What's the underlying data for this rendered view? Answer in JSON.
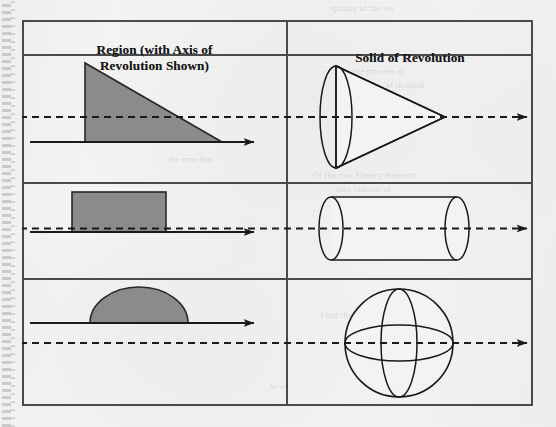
{
  "document": {
    "kind": "textbook-table",
    "page_background": "#f2f2f0",
    "ink_color": "#1a1a1c",
    "region_fill_color": "#8b8b8b",
    "binding": "spiral-perforation-strip"
  },
  "table": {
    "columns": [
      {
        "id": "region",
        "header_line1": "Region (with Axis of",
        "header_line2": "Revolution Shown)"
      },
      {
        "id": "solid",
        "header_line1": "Solid of Revolution",
        "header_line2": ""
      }
    ],
    "rows": [
      {
        "id": "row-cone",
        "region": {
          "shape_name": "right-triangle-region",
          "description": "Shaded right triangle with vertical leg on the left standing on the axis",
          "fill": "#8b8b8b"
        },
        "solid": {
          "shape_name": "cone-solid",
          "description": "Cone with circular base at left and apex at right, dashed axis through it"
        },
        "axis": {
          "style": "solid-arrow",
          "solid_style": "dashed-arrow"
        }
      },
      {
        "id": "row-cylinder",
        "region": {
          "shape_name": "rectangle-region",
          "description": "Shaded rectangle standing on the axis",
          "fill": "#8b8b8b"
        },
        "solid": {
          "shape_name": "cylinder-solid",
          "description": "Cylinder with circular ends, dashed axis through it"
        },
        "axis": {
          "style": "solid-arrow",
          "solid_style": "dashed-arrow"
        }
      },
      {
        "id": "row-sphere",
        "region": {
          "shape_name": "semicircle-region",
          "description": "Shaded half disk with flat side on the axis",
          "fill": "#8b8b8b"
        },
        "solid": {
          "shape_name": "sphere-solid",
          "description": "Sphere with equator and meridian ellipses, dashed axis through it"
        },
        "axis": {
          "style": "solid-arrow",
          "solid_style": "dashed-arrow"
        }
      }
    ]
  },
  "background_bleed": [
    {
      "text": "sprung of the set",
      "x": 330,
      "y": 3,
      "size": 9,
      "rotate": -0.4
    },
    {
      "text": "the process of",
      "x": 352,
      "y": 66,
      "size": 9,
      "rotate": -0.3
    },
    {
      "text": "of dround",
      "x": 386,
      "y": 80,
      "size": 9,
      "rotate": -0.3
    },
    {
      "text": "to the",
      "x": 120,
      "y": 112,
      "size": 8,
      "rotate": 0
    },
    {
      "text": "the term that",
      "x": 168,
      "y": 155,
      "size": 8,
      "rotate": 0
    },
    {
      "text": "Of the two Theory element",
      "x": 312,
      "y": 170,
      "size": 9,
      "rotate": -0.2
    },
    {
      "text": "into volume of",
      "x": 336,
      "y": 184,
      "size": 9,
      "rotate": -0.2
    },
    {
      "text": "under a portion of",
      "x": 370,
      "y": 216,
      "size": 9,
      "rotate": -0.2
    },
    {
      "text": "there",
      "x": 376,
      "y": 248,
      "size": 8,
      "rotate": 0
    },
    {
      "text": "Find the volume",
      "x": 320,
      "y": 310,
      "size": 9,
      "rotate": -0.2
    },
    {
      "text": "hi wa",
      "x": 270,
      "y": 382,
      "size": 8,
      "rotate": 0
    }
  ]
}
